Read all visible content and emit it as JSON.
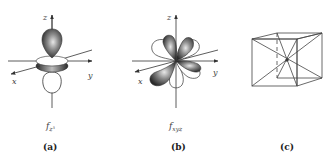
{
  "panels": [
    {
      "id": "a",
      "caption": "(a)",
      "orbital_label_main": "f",
      "orbital_label_sub": "z³",
      "axes": {
        "x": "x",
        "y": "y",
        "z": "z"
      }
    },
    {
      "id": "b",
      "caption": "(b)",
      "orbital_label_main": "f",
      "orbital_label_sub": "xyz",
      "axes": {
        "x": "x",
        "y": "y",
        "z": "z"
      }
    },
    {
      "id": "c",
      "caption": "(c)"
    }
  ],
  "colors": {
    "lobe_dark": "#3a3a3a",
    "lobe_light": "#ffffff",
    "line": "#333333"
  }
}
